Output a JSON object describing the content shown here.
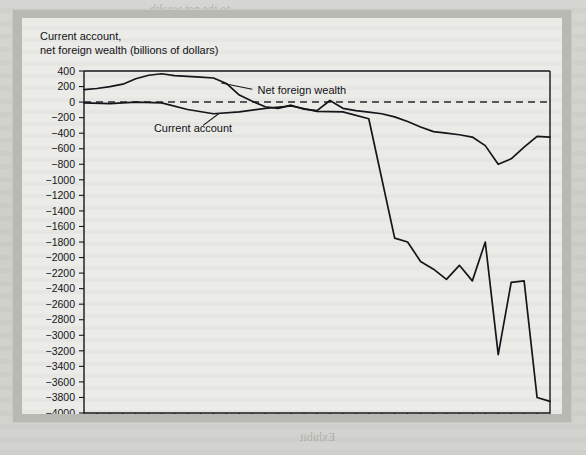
{
  "figure": {
    "title_line1": "Current account,",
    "title_line2": "net foreign wealth (billions of dollars)"
  },
  "chart_data": {
    "type": "line",
    "title": "Current account, net foreign wealth (billions of dollars)",
    "xlabel": "",
    "ylabel": "billions of dollars",
    "xlim": [
      1976,
      2012
    ],
    "ylim": [
      -4000,
      400
    ],
    "ytick_step": 200,
    "xtick_step": 2,
    "grid": false,
    "zero_reference_line": true,
    "legend_position": "inline-annotations",
    "yticks": [
      400,
      200,
      0,
      -200,
      -400,
      -600,
      -800,
      -1000,
      -1200,
      -1400,
      -1600,
      -1800,
      -2000,
      -2200,
      -2400,
      -2600,
      -2800,
      -3000,
      -3200,
      -3400,
      -3600,
      -3800,
      -4000
    ],
    "ytick_labels": [
      "400",
      "200",
      "0",
      "−200",
      "−400",
      "−600",
      "−800",
      "−1000",
      "−1200",
      "−1400",
      "−1600",
      "−1800",
      "−2000",
      "−2200",
      "−2400",
      "−2600",
      "−2800",
      "−3000",
      "−3200",
      "−3400",
      "−3600",
      "−3800",
      "−4000"
    ],
    "xticks": [
      1976,
      1978,
      1980,
      1982,
      1984,
      1986,
      1988,
      1990,
      1992,
      1994,
      1996,
      1998,
      2000,
      2002,
      2004,
      2006,
      2008,
      2010,
      2012
    ],
    "xtick_labels": [
      "1976",
      "1978",
      "1980",
      "1982",
      "1984",
      "1986",
      "1988",
      "1990",
      "1992",
      "1994",
      "1996",
      "1998",
      "2000",
      "2002",
      "2004",
      "2006",
      "2008",
      "2010",
      "2012"
    ],
    "x": [
      1976,
      1977,
      1978,
      1979,
      1980,
      1981,
      1982,
      1983,
      1984,
      1985,
      1986,
      1987,
      1988,
      1989,
      1990,
      1991,
      1992,
      1993,
      1994,
      1995,
      1996,
      1997,
      1998,
      1999,
      2000,
      2001,
      2002,
      2003,
      2004,
      2005,
      2006,
      2007,
      2008,
      2009,
      2010,
      2011,
      2012
    ],
    "series": [
      {
        "name": "Net foreign wealth",
        "label": "Net foreign wealth",
        "values": [
          160,
          175,
          200,
          230,
          300,
          345,
          365,
          340,
          330,
          320,
          310,
          240,
          90,
          10,
          -60,
          -80,
          -40,
          -90,
          -110,
          20,
          -80,
          -110,
          -130,
          -150,
          -190,
          -250,
          -320,
          -380,
          -400,
          -420,
          -450,
          -560,
          -800,
          -730,
          -580,
          -440,
          -450
        ],
        "label_x": 1988,
        "label_y": 150
      },
      {
        "name": "Current account",
        "label": "Current account",
        "values": [
          -10,
          -20,
          -20,
          -10,
          0,
          10,
          -10,
          -40,
          -95,
          -120,
          -150,
          -165,
          -125,
          -100,
          -80,
          0,
          -50,
          -85,
          -120,
          -110,
          -125,
          -145,
          -215,
          -300,
          -415,
          -395,
          -460,
          -520,
          -630,
          -745,
          -800,
          -710,
          -680,
          -335,
          -440,
          -470,
          -490
        ],
        "label_x": 1985,
        "label_y": -330
      }
    ]
  },
  "current_account_deep": {
    "x": [
      1976,
      1978,
      1980,
      1982,
      1984,
      1986,
      1988,
      1990,
      1992,
      1994,
      1996,
      1998,
      2000,
      2001,
      2002,
      2003,
      2004,
      2005,
      2006,
      2007,
      2008,
      2009,
      2010,
      2011,
      2012
    ],
    "values": [
      -10,
      -20,
      0,
      -10,
      -95,
      -150,
      -125,
      -80,
      -50,
      -120,
      -125,
      -215,
      -1750,
      -1800,
      -2050,
      -2150,
      -2280,
      -2100,
      -2300,
      -1800,
      -3250,
      -2320,
      -2300,
      -3800,
      -3850
    ]
  },
  "annotations": {
    "net_foreign_wealth_label": "Net foreign wealth",
    "current_account_label": "Current account"
  },
  "colors": {
    "line": "#15151a",
    "axis": "#16161a",
    "card_background": "#ebebe8",
    "frame": "#b9b9b4",
    "page_background": "#d3d3cf"
  }
}
